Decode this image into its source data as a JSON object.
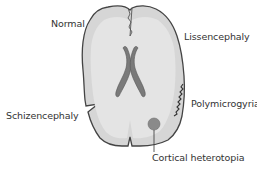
{
  "diagram": {
    "labels": {
      "normal": "Normal",
      "lissencephaly": "Lissencephaly",
      "schizencephaly": "Schizencephaly",
      "polymicrogyria": "Polymicrogyria",
      "cortical_heterotopia": "Cortical heterotopia"
    },
    "colors": {
      "cortex_fill": "#d9d9d9",
      "cortex_outline": "#444444",
      "white_matter": "#e6e6e6",
      "ventricles": "#7a7a7a",
      "heterotopia": "#8a8a8a",
      "text": "#333333"
    }
  }
}
